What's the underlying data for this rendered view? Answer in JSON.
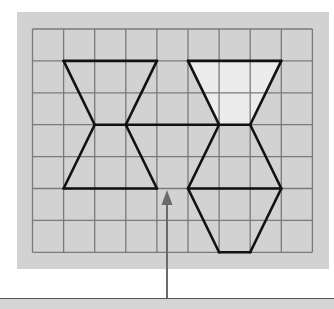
{
  "figure": {
    "panel": {
      "x": 17,
      "y": 12,
      "width": 312,
      "height": 257,
      "fill": "#d2d2d2"
    },
    "grid": {
      "origin_x": 32.5,
      "origin_y": 29,
      "cols": 9,
      "rows": 7,
      "cell_w": 31.1,
      "cell_h": 31.9,
      "line_color": "#7a7a7a",
      "line_width": 1.3
    },
    "shapes": {
      "stroke": "#111111",
      "stroke_width": 2.6,
      "highlight_fill": "#ececec",
      "highlighted_trapezoid": [
        [
          5,
          1
        ],
        [
          8,
          1
        ],
        [
          7,
          3
        ],
        [
          6,
          3
        ]
      ],
      "segments": [
        [
          [
            1,
            1
          ],
          [
            4,
            1
          ]
        ],
        [
          [
            5,
            1
          ],
          [
            8,
            1
          ]
        ],
        [
          [
            1,
            1
          ],
          [
            2,
            3
          ]
        ],
        [
          [
            4,
            1
          ],
          [
            3,
            3
          ]
        ],
        [
          [
            5,
            1
          ],
          [
            6,
            3
          ]
        ],
        [
          [
            8,
            1
          ],
          [
            7,
            3
          ]
        ],
        [
          [
            2,
            3
          ],
          [
            7,
            3
          ]
        ],
        [
          [
            2,
            3
          ],
          [
            1,
            5
          ]
        ],
        [
          [
            3,
            3
          ],
          [
            4,
            5
          ]
        ],
        [
          [
            6,
            3
          ],
          [
            5,
            5
          ]
        ],
        [
          [
            7,
            3
          ],
          [
            8,
            5
          ]
        ],
        [
          [
            1,
            5
          ],
          [
            4,
            5
          ]
        ],
        [
          [
            5,
            5
          ],
          [
            8,
            5
          ]
        ],
        [
          [
            5,
            5
          ],
          [
            6,
            7
          ]
        ],
        [
          [
            8,
            5
          ],
          [
            7,
            7
          ]
        ],
        [
          [
            6,
            7
          ],
          [
            7,
            7
          ]
        ]
      ]
    },
    "arrow": {
      "x": 167,
      "y_start": 299,
      "y_tip": 190,
      "color": "#6a6a6a",
      "points_to": "gap on row-5 baseline between the two shape groups"
    },
    "baseline": {
      "y": 299,
      "color": "#555555"
    }
  }
}
